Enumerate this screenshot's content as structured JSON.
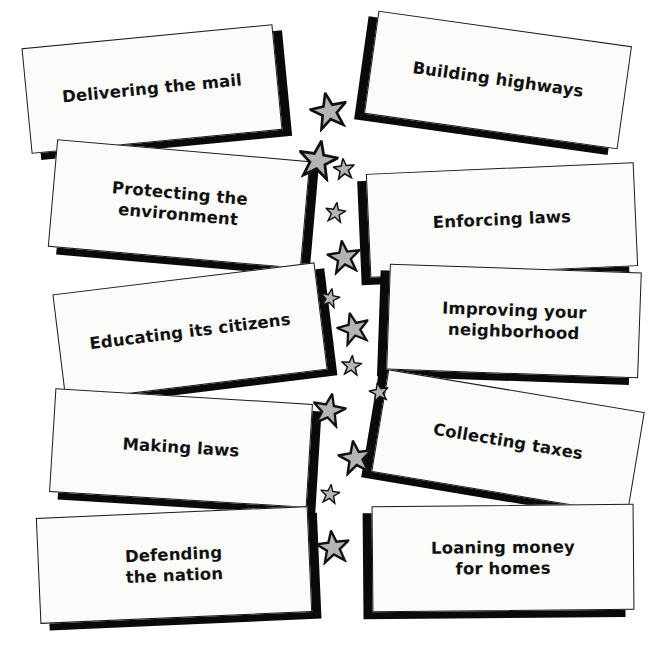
{
  "page": {
    "background_color": "#ffffff",
    "width": 664,
    "height": 665
  },
  "style": {
    "card_face_color": "#fbfbfa",
    "card_border_color": "#1a1a1a",
    "card_shadow_color": "#0a0a0a",
    "text_color": "#111111",
    "star_fill_color": "#b4b4b4",
    "star_outline_color": "#111111"
  },
  "left_column": {
    "cards": [
      {
        "id": "delivering-the-mail",
        "label": "Delivering the mail",
        "x": 26,
        "y": 36,
        "w": 252,
        "h": 106,
        "rotate": -5.5,
        "shadow_dx": 9,
        "shadow_dy": 7,
        "font_size": 16.5
      },
      {
        "id": "protecting-the-environment",
        "label": "Protecting the\nenvironment",
        "x": 52,
        "y": 150,
        "w": 254,
        "h": 108,
        "rotate": 5.0,
        "shadow_dx": 9,
        "shadow_dy": 7,
        "font_size": 16.5
      },
      {
        "id": "educating-its-citizens",
        "label": "Educating its citizens",
        "x": 58,
        "y": 278,
        "w": 264,
        "h": 108,
        "rotate": -7.0,
        "shadow_dx": 9,
        "shadow_dy": 7,
        "font_size": 16.5
      },
      {
        "id": "making-laws",
        "label": "Making laws",
        "x": 52,
        "y": 396,
        "w": 258,
        "h": 104,
        "rotate": 3.5,
        "shadow_dx": 9,
        "shadow_dy": 7,
        "font_size": 16.5
      },
      {
        "id": "defending-the-nation",
        "label": "Defending\nthe nation",
        "x": 38,
        "y": 512,
        "w": 272,
        "h": 106,
        "rotate": -2.5,
        "shadow_dx": 9,
        "shadow_dy": 7,
        "font_size": 16.5
      }
    ]
  },
  "right_column": {
    "cards": [
      {
        "id": "building-highways",
        "label": "Building highways",
        "x": 370,
        "y": 28,
        "w": 256,
        "h": 104,
        "rotate": 8.0,
        "shadow_dx": -9,
        "shadow_dy": 7,
        "font_size": 16.5
      },
      {
        "id": "enforcing-laws",
        "label": "Enforcing laws",
        "x": 368,
        "y": 168,
        "w": 268,
        "h": 104,
        "rotate": -2.5,
        "shadow_dx": -9,
        "shadow_dy": 7,
        "font_size": 16.5
      },
      {
        "id": "improving-your-neighborhood",
        "label": "Improving your\nneighborhood",
        "x": 388,
        "y": 268,
        "w": 252,
        "h": 106,
        "rotate": 2.0,
        "shadow_dx": -9,
        "shadow_dy": 7,
        "font_size": 16.5
      },
      {
        "id": "collecting-taxes",
        "label": "Collecting taxes",
        "x": 378,
        "y": 390,
        "w": 260,
        "h": 104,
        "rotate": 9.5,
        "shadow_dx": -9,
        "shadow_dy": 7,
        "font_size": 16.5
      },
      {
        "id": "loaning-money-for-homes",
        "label": "Loaning money\nfor homes",
        "x": 372,
        "y": 505,
        "w": 262,
        "h": 106,
        "rotate": -0.5,
        "shadow_dx": -9,
        "shadow_dy": 7,
        "font_size": 16.5
      }
    ]
  },
  "stars": {
    "items": [
      {
        "x": 310,
        "y": 92,
        "size": 38,
        "rotate": -12
      },
      {
        "x": 298,
        "y": 140,
        "size": 40,
        "rotate": 10
      },
      {
        "x": 333,
        "y": 158,
        "size": 22,
        "rotate": -6
      },
      {
        "x": 325,
        "y": 202,
        "size": 21,
        "rotate": 8
      },
      {
        "x": 327,
        "y": 240,
        "size": 34,
        "rotate": -8
      },
      {
        "x": 320,
        "y": 288,
        "size": 20,
        "rotate": 12
      },
      {
        "x": 337,
        "y": 312,
        "size": 33,
        "rotate": -14
      },
      {
        "x": 341,
        "y": 355,
        "size": 21,
        "rotate": 5
      },
      {
        "x": 369,
        "y": 382,
        "size": 20,
        "rotate": -10
      },
      {
        "x": 312,
        "y": 393,
        "size": 34,
        "rotate": 11
      },
      {
        "x": 338,
        "y": 440,
        "size": 35,
        "rotate": -9
      },
      {
        "x": 320,
        "y": 484,
        "size": 20,
        "rotate": 7
      },
      {
        "x": 316,
        "y": 530,
        "size": 34,
        "rotate": -7
      }
    ]
  }
}
